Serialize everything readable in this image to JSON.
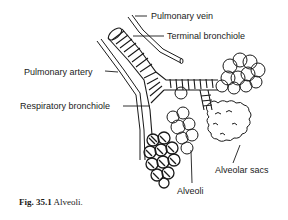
{
  "figure": {
    "caption_number": "Fig. 35.1",
    "caption_text": "Alveoli.",
    "labels": {
      "pulmonary_vein": "Pulmonary vein",
      "terminal_bronchiole": "Terminal bronchiole",
      "pulmonary_artery": "Pulmonary artery",
      "respiratory_bronchiole": "Respiratory bronchiole",
      "alveoli": "Alveoli",
      "alveolar_sacs": "Alveolar sacs"
    },
    "colors": {
      "ink": "#1a1a1a",
      "background": "#ffffff"
    }
  }
}
